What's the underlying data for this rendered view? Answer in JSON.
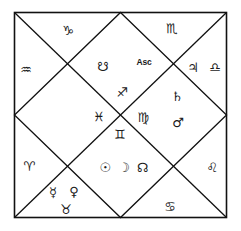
{
  "chart": {
    "style": "north-indian-kundali",
    "line_color": "#111111",
    "background_color": "#ffffff",
    "text_color": "#1a1a1a",
    "ascendant_label": "Asc",
    "frame": {
      "left": 14,
      "top": 12,
      "right": 227,
      "bottom": 218
    }
  },
  "signs": {
    "capricorn": "♑",
    "aquarius": "♒",
    "pisces": "♓",
    "aries": "♈",
    "taurus": "♉",
    "gemini": "♊",
    "cancer": "♋",
    "leo": "♌",
    "virgo": "♍",
    "libra": "♎",
    "scorpio": "♏",
    "sagittarius": "♐"
  },
  "planets": {
    "sun": "☉",
    "moon": "☽",
    "mars": "♂",
    "mercury": "☿",
    "jupiter": "♃",
    "venus": "♀",
    "saturn": "♄",
    "rahu": "☊",
    "ketu": "☋"
  },
  "houses": [
    {
      "house": 1,
      "position": "top-center-diamond",
      "sign_glyph": "☋",
      "sign_name": "ketu",
      "label": "Asc",
      "planets": [
        "ketu"
      ]
    },
    {
      "house": 2,
      "position": "top-left-triangle",
      "sign_glyph": "♑",
      "sign_name": "capricorn",
      "planets": []
    },
    {
      "house": 3,
      "position": "left-upper-triangle",
      "sign_glyph": "♒",
      "sign_name": "aquarius",
      "planets": []
    },
    {
      "house": 4,
      "position": "left-center-diamond",
      "sign_glyph": "♓",
      "sign_name": "pisces",
      "planets": []
    },
    {
      "house": 5,
      "position": "left-lower-triangle",
      "sign_glyph": "♈",
      "sign_name": "aries",
      "planets": []
    },
    {
      "house": 6,
      "position": "bottom-left-triangle",
      "sign_glyph": "♉",
      "sign_name": "taurus",
      "planets": [
        "mercury",
        "venus"
      ]
    },
    {
      "house": 7,
      "position": "bottom-center-diamond",
      "sign_glyph": "♊",
      "sign_name": "gemini",
      "planets": [
        "sun",
        "moon",
        "rahu"
      ]
    },
    {
      "house": 8,
      "position": "bottom-right-triangle",
      "sign_glyph": "♋",
      "sign_name": "cancer",
      "planets": []
    },
    {
      "house": 9,
      "position": "right-lower-triangle",
      "sign_glyph": "♌",
      "sign_name": "leo",
      "planets": []
    },
    {
      "house": 10,
      "position": "right-center-diamond",
      "sign_glyph": "♍",
      "sign_name": "virgo",
      "planets": [
        "saturn",
        "mars"
      ]
    },
    {
      "house": 11,
      "position": "right-upper-triangle",
      "sign_glyph": "♎",
      "sign_name": "libra",
      "planets": [
        "jupiter"
      ]
    },
    {
      "house": 12,
      "position": "top-right-triangle",
      "sign_glyph": "♏",
      "sign_name": "scorpio",
      "planets": []
    }
  ],
  "glyph_placements": {
    "capricorn": "♑",
    "scorpio": "♏",
    "aquarius": "♒",
    "ketu": "☋",
    "asc": "Asc",
    "jupiter": "♃",
    "libra": "♎",
    "sagittarius": "♐",
    "saturn": "♄",
    "pisces": "♓",
    "virgo": "♍",
    "mars": "♂",
    "gemini": "♊",
    "aries": "♈",
    "sun": "☉",
    "moon": "☽",
    "rahu": "☊",
    "leo": "♌",
    "mercury": "☿",
    "venus": "♀",
    "taurus": "♉",
    "cancer": "♋"
  }
}
